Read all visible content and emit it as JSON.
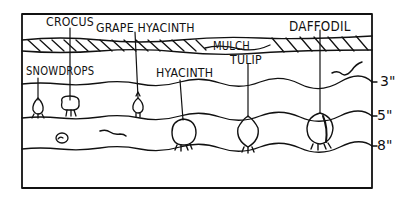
{
  "diagram": {
    "type": "bulb-planting-depth-illustration",
    "labels": {
      "crocus": "CROCUS",
      "grape_hyacinth": "GRAPE HYACINTH",
      "daffodil": "DAFFODIL",
      "mulch": "MULCH",
      "tulip": "TULIP",
      "snowdrops": "SNOWDROPS",
      "hyacinth": "HYACINTH"
    },
    "depths": {
      "d3": "3\"",
      "d5": "5\"",
      "d8": "8\""
    },
    "bulbs": [
      {
        "name": "Snowdrops",
        "depth": "3\""
      },
      {
        "name": "Crocus",
        "depth": "3\""
      },
      {
        "name": "Grape Hyacinth",
        "depth": "3\""
      },
      {
        "name": "Hyacinth",
        "depth": "8\""
      },
      {
        "name": "Tulip",
        "depth": "8\""
      },
      {
        "name": "Daffodil",
        "depth": "8\""
      }
    ],
    "colors": {
      "ink": "#111111",
      "background": "#ffffff"
    }
  }
}
